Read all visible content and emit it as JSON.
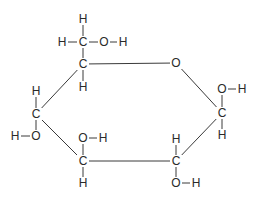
{
  "diagram": {
    "type": "chemical-structure",
    "colors": {
      "bond": "#3a3a3a",
      "text": "#2a2a2a",
      "background": "#ffffff"
    },
    "atoms": [
      {
        "id": "h_top",
        "label": "H",
        "x": 83,
        "y": 19
      },
      {
        "id": "h_c6_left",
        "label": "H",
        "x": 62,
        "y": 42
      },
      {
        "id": "c6",
        "label": "C",
        "x": 83,
        "y": 42
      },
      {
        "id": "o6",
        "label": "O",
        "x": 104,
        "y": 42
      },
      {
        "id": "h_o6",
        "label": "H",
        "x": 123,
        "y": 42
      },
      {
        "id": "c5",
        "label": "C",
        "x": 83,
        "y": 64
      },
      {
        "id": "h_c5",
        "label": "H",
        "x": 83,
        "y": 87
      },
      {
        "id": "o_ring",
        "label": "O",
        "x": 176,
        "y": 63
      },
      {
        "id": "o1",
        "label": "O",
        "x": 222,
        "y": 89
      },
      {
        "id": "h_o1",
        "label": "H",
        "x": 242,
        "y": 89
      },
      {
        "id": "c1",
        "label": "C",
        "x": 222,
        "y": 113
      },
      {
        "id": "h_c1",
        "label": "H",
        "x": 222,
        "y": 135
      },
      {
        "id": "h_c4",
        "label": "H",
        "x": 36,
        "y": 91
      },
      {
        "id": "c4",
        "label": "C",
        "x": 36,
        "y": 114
      },
      {
        "id": "h_o4",
        "label": "H",
        "x": 15,
        "y": 136
      },
      {
        "id": "o4",
        "label": "O",
        "x": 36,
        "y": 136
      },
      {
        "id": "o3",
        "label": "O",
        "x": 83,
        "y": 138
      },
      {
        "id": "h_o3",
        "label": "H",
        "x": 103,
        "y": 138
      },
      {
        "id": "c3",
        "label": "C",
        "x": 83,
        "y": 161
      },
      {
        "id": "h_c3",
        "label": "H",
        "x": 83,
        "y": 183
      },
      {
        "id": "h_c2",
        "label": "H",
        "x": 176,
        "y": 139
      },
      {
        "id": "c2",
        "label": "C",
        "x": 176,
        "y": 161
      },
      {
        "id": "o2",
        "label": "O",
        "x": 176,
        "y": 183
      },
      {
        "id": "h_o2",
        "label": "H",
        "x": 196,
        "y": 183
      }
    ],
    "bonds": [
      {
        "from": "h_top",
        "to": "c6"
      },
      {
        "from": "h_c6_left",
        "to": "c6"
      },
      {
        "from": "c6",
        "to": "o6"
      },
      {
        "from": "o6",
        "to": "h_o6"
      },
      {
        "from": "c6",
        "to": "c5"
      },
      {
        "from": "c5",
        "to": "h_c5"
      },
      {
        "from": "c5",
        "to": "o_ring"
      },
      {
        "from": "o_ring",
        "to": "c1"
      },
      {
        "from": "c1",
        "to": "o1"
      },
      {
        "from": "o1",
        "to": "h_o1"
      },
      {
        "from": "c1",
        "to": "h_c1"
      },
      {
        "from": "c1",
        "to": "c2"
      },
      {
        "from": "c2",
        "to": "h_c2"
      },
      {
        "from": "c2",
        "to": "o2"
      },
      {
        "from": "o2",
        "to": "h_o2"
      },
      {
        "from": "c2",
        "to": "c3"
      },
      {
        "from": "c3",
        "to": "o3"
      },
      {
        "from": "o3",
        "to": "h_o3"
      },
      {
        "from": "c3",
        "to": "h_c3"
      },
      {
        "from": "c3",
        "to": "c4"
      },
      {
        "from": "c4",
        "to": "h_c4"
      },
      {
        "from": "c4",
        "to": "o4"
      },
      {
        "from": "o4",
        "to": "h_o4"
      },
      {
        "from": "c4",
        "to": "c5"
      }
    ]
  }
}
